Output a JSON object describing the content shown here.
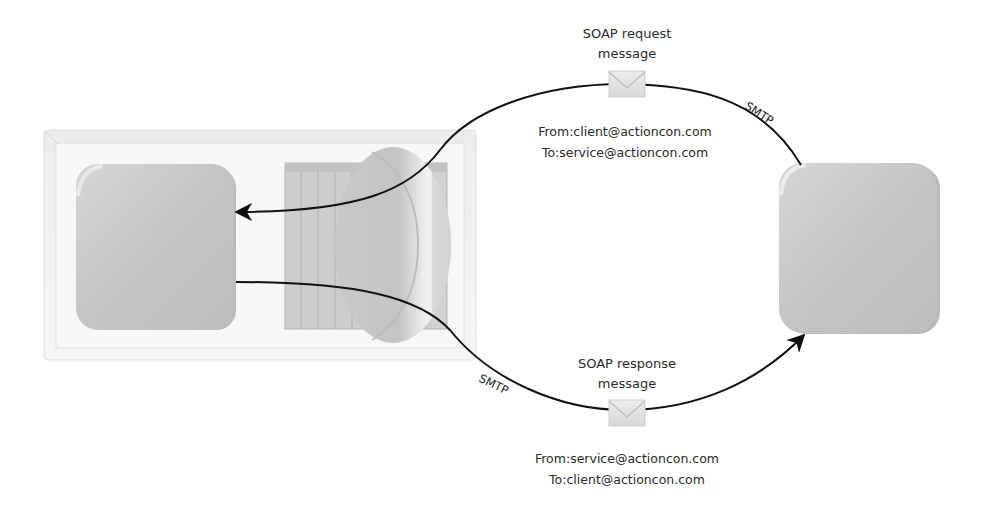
{
  "diagram": {
    "request": {
      "title_line1": "SOAP request",
      "title_line2": "message",
      "from": "From:client@actioncon.com",
      "to": "To:service@actioncon.com",
      "transport": "SMTP",
      "icon": "envelope-icon"
    },
    "response": {
      "title_line1": "SOAP response",
      "title_line2": "message",
      "from": "From:service@actioncon.com",
      "to": "To:client@actioncon.com",
      "transport": "SMTP",
      "icon": "envelope-icon"
    },
    "nodes": [
      {
        "id": "client-node",
        "shape": "rounded-square",
        "color": "#c8c8c8"
      },
      {
        "id": "message-queue",
        "shape": "stacked-cylinder",
        "color": "#cfcfcf"
      },
      {
        "id": "service-node",
        "shape": "rounded-square",
        "color": "#c8c8c8"
      }
    ],
    "colors": {
      "node_fill": "#c6c6c6",
      "frame_fill": "#f2f2f2",
      "line": "#111111",
      "text": "#2a2a2a"
    }
  }
}
